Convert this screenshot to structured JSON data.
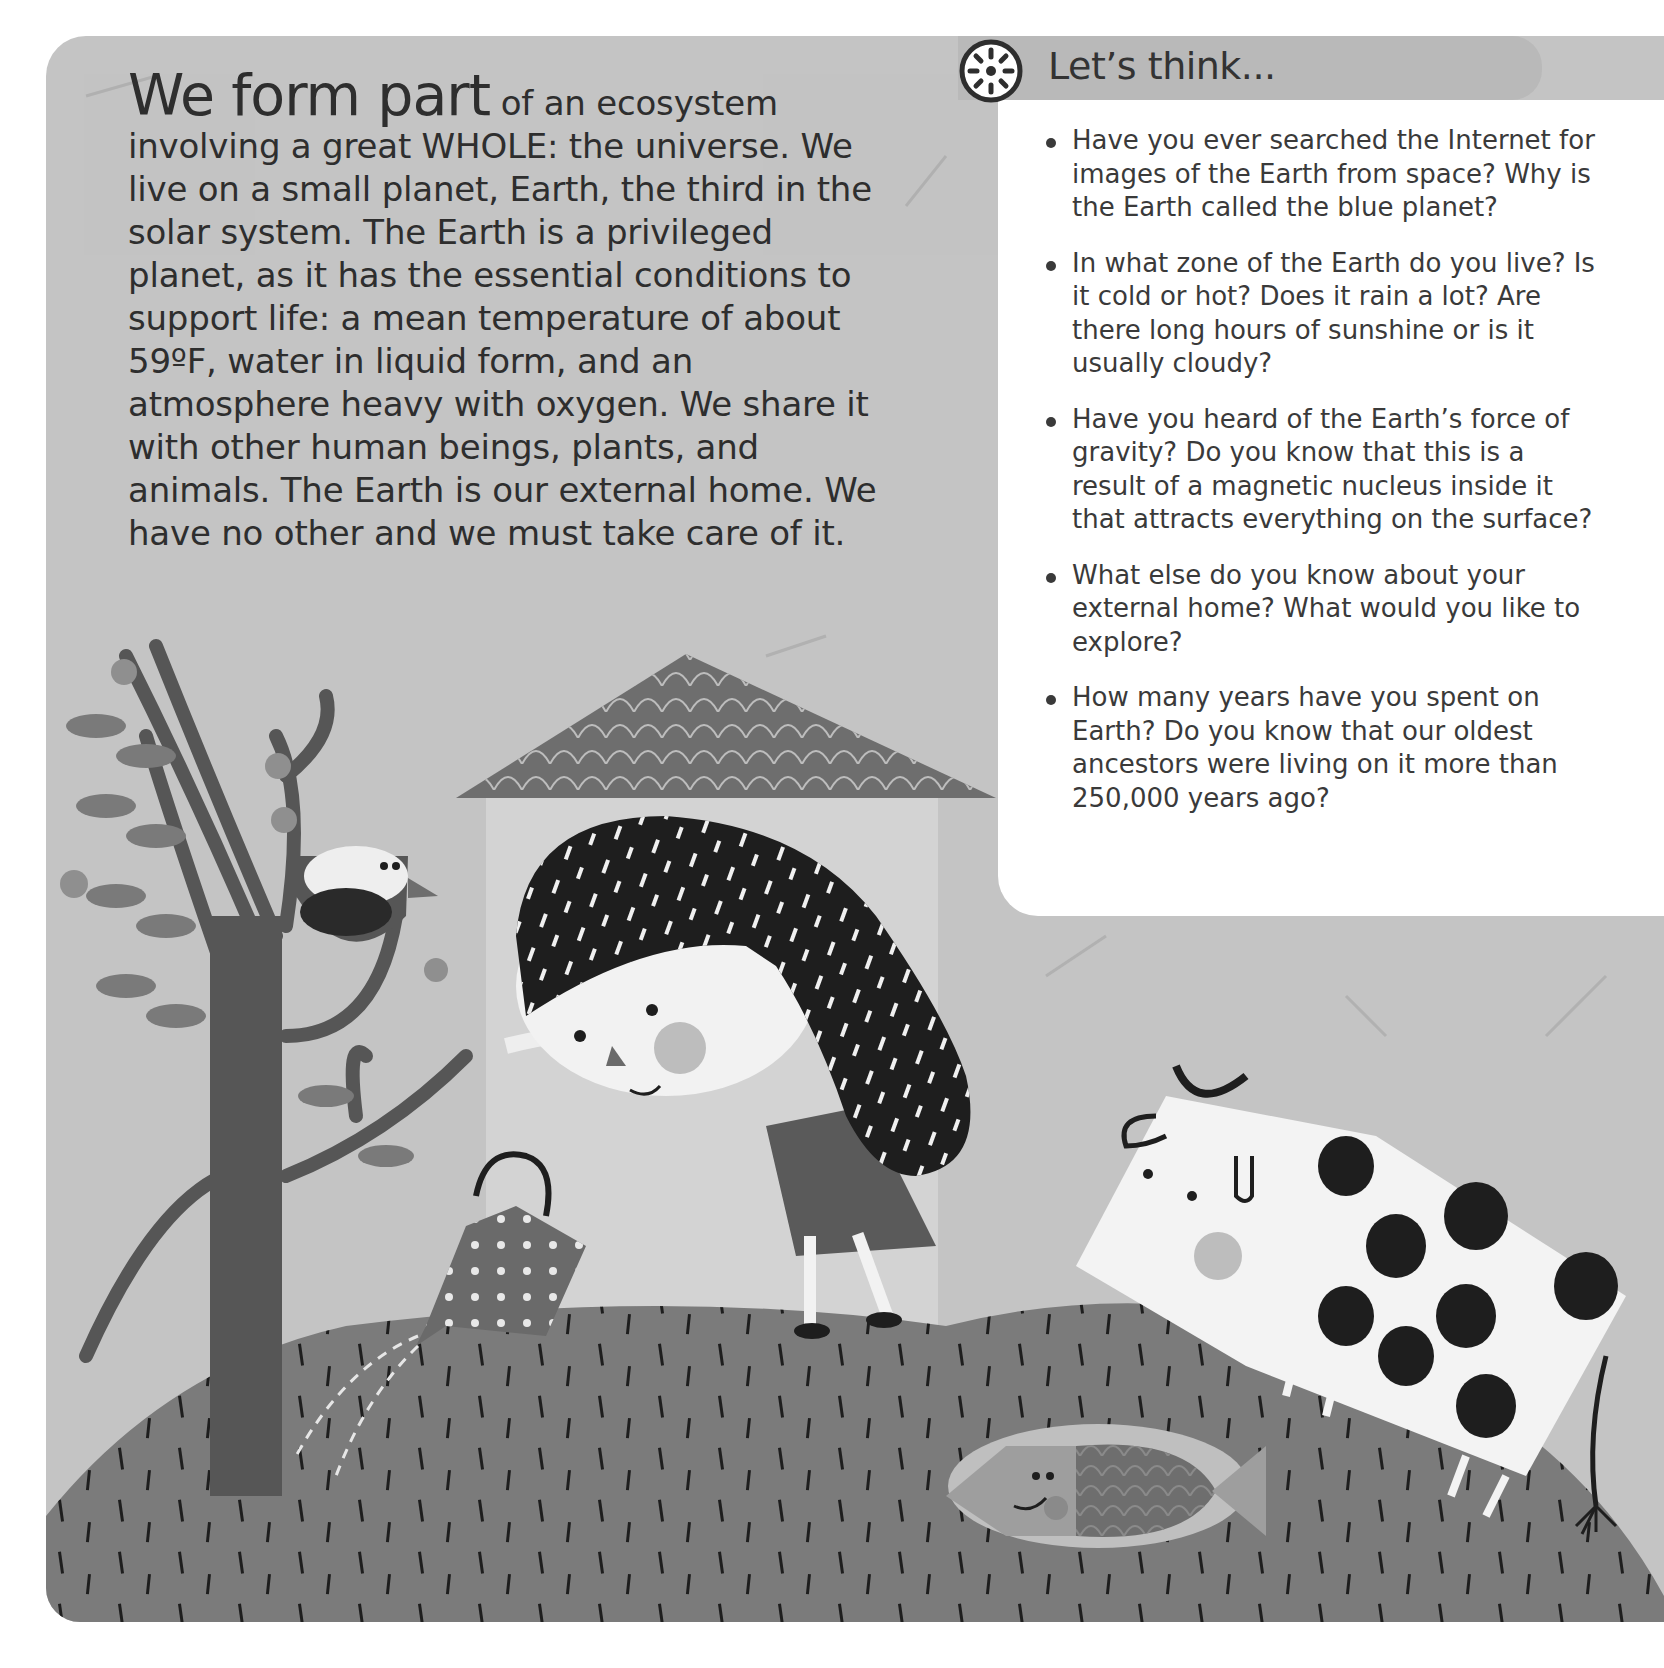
{
  "intro": {
    "lead": "We form part",
    "body": " of an ecosystem involving a great WHOLE: the universe. We live on a small planet, Earth, the third in the solar system. The Earth is a privileged planet, as it has the essential conditions to support life: a mean temperature of about 59ºF, water in liquid form, and an atmosphere heavy with oxygen. We share it with other human beings, plants, and animals. The Earth is our external home. We have no other and we must take care of it."
  },
  "think": {
    "icon": "sun-wheel-icon",
    "title": "Let’s think...",
    "questions": [
      "Have you ever searched the Internet for images of the Earth from space? Why is the Earth called the blue planet?",
      "In what zone of the Earth do you live? Is it cold or hot? Does it rain a lot? Are there long hours of sunshine or is it usually cloudy?",
      "Have you heard of the Earth’s force of gravity? Do you know that this is a result of a magnetic nucleus inside it that attracts everything on the surface?",
      "What else do you know about your external home? What would you like to explore?",
      "How many years have you spent on Earth? Do you know that our oldest ancestors were living on it more than 250,000 years ago?"
    ]
  },
  "illustration": {
    "elements": [
      "tree",
      "bird-in-nest",
      "house",
      "girl-with-watering-can",
      "cow",
      "fish-in-pond",
      "hill"
    ],
    "colors": {
      "background": "#c4c4c4",
      "hill": "#7b7b7b",
      "dark": "#1e1e1e",
      "tree": "#565656",
      "roof": "#6e6e6e",
      "house": "#d3d3d3",
      "white": "#f4f4f4"
    }
  }
}
